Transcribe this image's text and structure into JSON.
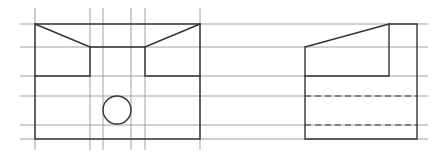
{
  "diagram": {
    "type": "orthographic-projection",
    "views": [
      "front-view",
      "side-view"
    ],
    "colors": {
      "background": "#ffffff",
      "line": "#333333",
      "construction": "#8a8a8a"
    },
    "construction_lines": {
      "horizontal_y": [
        24,
        47,
        76,
        96,
        125,
        139
      ],
      "vertical_x": [
        35,
        90,
        103,
        131,
        145,
        200
      ]
    },
    "front_view": {
      "outer_rect": {
        "x1": 35,
        "y1": 24,
        "x2": 200,
        "y2": 139
      },
      "notch": {
        "left_x": 90,
        "right_x": 145,
        "top_y": 47,
        "bottom_y": 76
      },
      "circle": {
        "cx": 117,
        "cy": 110,
        "r": 14
      }
    },
    "side_view": {
      "left_x": 305,
      "inner_x": 389,
      "right_x": 417,
      "top_y": 24,
      "slope_start_y": 47,
      "step_y": 76,
      "bottom_y": 139,
      "hidden_lines_y": [
        96,
        125
      ]
    }
  }
}
